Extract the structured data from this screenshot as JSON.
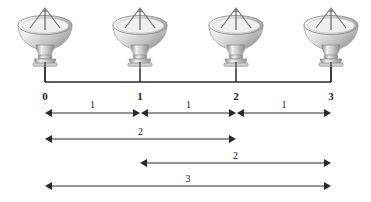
{
  "figure": {
    "background": "#ffffff",
    "width": 371,
    "height": 202
  },
  "axis": {
    "name": "position-axis",
    "color": "#2a2a2a",
    "y": 82,
    "tick_top": 69,
    "x_positions": [
      45,
      140,
      236,
      331
    ],
    "labels": [
      {
        "text": "0",
        "x": 45,
        "y": 90
      },
      {
        "text": "1",
        "x": 140,
        "y": 90
      },
      {
        "text": "2",
        "x": 236,
        "y": 90
      },
      {
        "text": "3",
        "x": 331,
        "y": 90
      }
    ]
  },
  "antennas": [
    {
      "name": "antenna-dish-0",
      "x": 45,
      "y": 4,
      "station": "0"
    },
    {
      "name": "antenna-dish-1",
      "x": 140,
      "y": 4,
      "station": "1"
    },
    {
      "name": "antenna-dish-2",
      "x": 236,
      "y": 4,
      "station": "2"
    },
    {
      "name": "antenna-dish-3",
      "x": 331,
      "y": 4,
      "station": "3"
    }
  ],
  "baselines": [
    {
      "name": "baseline-0-1",
      "label": "1",
      "from": 45,
      "to": 140,
      "y": 113,
      "label_y": 99
    },
    {
      "name": "baseline-1-2",
      "label": "1",
      "from": 141,
      "to": 236,
      "y": 113,
      "label_y": 99
    },
    {
      "name": "baseline-2-3",
      "label": "1",
      "from": 237,
      "to": 331,
      "y": 113,
      "label_y": 99
    },
    {
      "name": "baseline-0-2",
      "label": "2",
      "from": 45,
      "to": 236,
      "y": 139,
      "label_y": 126
    },
    {
      "name": "baseline-1-3",
      "label": "2",
      "from": 140,
      "to": 331,
      "y": 163,
      "label_y": 150
    },
    {
      "name": "baseline-0-3",
      "label": "3",
      "from": 45,
      "to": 331,
      "y": 186,
      "label_y": 173
    }
  ],
  "chart_data": {
    "type": "diagram",
    "xlabel": "",
    "ylabel": "",
    "x_tick_labels": [
      "0",
      "1",
      "2",
      "3"
    ],
    "x_tick_positions": [
      0,
      1,
      2,
      3
    ],
    "element_type": "parabolic-dish-antenna",
    "element_count": 4,
    "measurements": [
      {
        "from": 0,
        "to": 1,
        "length": 1
      },
      {
        "from": 1,
        "to": 2,
        "length": 1
      },
      {
        "from": 2,
        "to": 3,
        "length": 1
      },
      {
        "from": 0,
        "to": 2,
        "length": 2
      },
      {
        "from": 1,
        "to": 3,
        "length": 2
      },
      {
        "from": 0,
        "to": 3,
        "length": 3
      }
    ],
    "unique_baseline_lengths": [
      1,
      2,
      3
    ],
    "grid": false,
    "legend": "none"
  },
  "colors": {
    "line": "#2a2a2a",
    "text": "#1d1d1d",
    "dish_light": "#f4f4f4",
    "dish_mid": "#c9c9c9",
    "dish_dark": "#8d8d8d",
    "background": "#ffffff"
  }
}
